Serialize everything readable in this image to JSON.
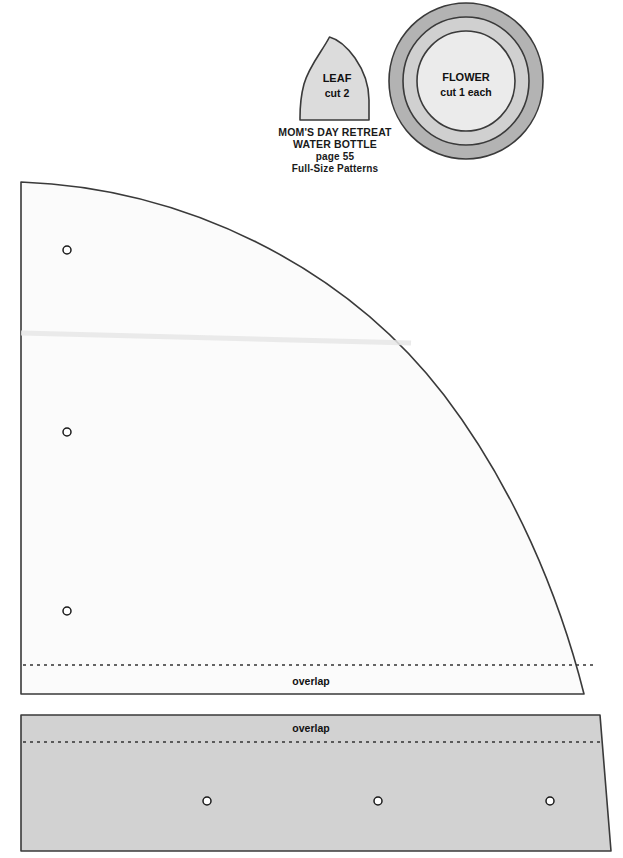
{
  "page": {
    "width": 623,
    "height": 858,
    "background": "#ffffff"
  },
  "title_block": {
    "line1": "MOM'S DAY RETREAT",
    "line2": "WATER BOTTLE",
    "line3": "page 55",
    "line4": "Full-Size Patterns"
  },
  "pieces": {
    "leaf": {
      "label": "LEAF",
      "quantity": "cut 2",
      "fill": "#dcdcdc",
      "stroke": "#3a3a3a"
    },
    "flower": {
      "label": "FLOWER",
      "quantity": "cut 1 each",
      "ring_outer_fill": "#b3b3b3",
      "ring_middle_fill": "#d0d0d0",
      "ring_inner_fill": "#ebebeb",
      "stroke": "#3a3a3a"
    },
    "upper_panel": {
      "overlap_label": "overlap",
      "fill": "#fbfbfb",
      "stroke": "#3a3a3a",
      "hole_count": 3
    },
    "lower_panel": {
      "overlap_label": "overlap",
      "fill": "#d2d2d2",
      "stroke": "#3a3a3a",
      "hole_count": 3
    }
  },
  "colors": {
    "page_background": "#ffffff",
    "ink": "#111111",
    "outline": "#3a3a3a",
    "hole_stroke": "#1a1a1a"
  }
}
